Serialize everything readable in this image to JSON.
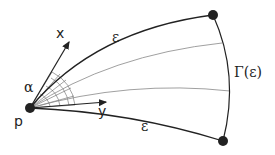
{
  "diagram": {
    "labels": {
      "x_axis": "x",
      "y_axis": "y",
      "angle": "α",
      "point": "p",
      "edge_top": "ε",
      "edge_bottom": "ε",
      "arc": "Γ(ε)"
    },
    "colors": {
      "stroke": "#222222",
      "thin_stroke": "#777777",
      "background": "#ffffff"
    }
  }
}
